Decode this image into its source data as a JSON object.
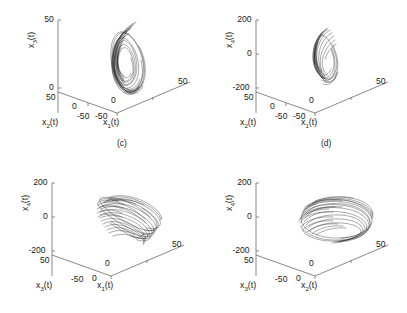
{
  "figure": {
    "type": "multi-panel-3d-phase-portrait",
    "panel_count": 4,
    "background_color": "#ffffff",
    "line_color": "#232323",
    "axis_color": "#6a6a6a",
    "captions": [
      {
        "id": "caption-c",
        "text": "(c)"
      },
      {
        "id": "caption-d",
        "text": "(d)"
      }
    ]
  },
  "chart_data": [
    {
      "id": "panel-c",
      "type": "line",
      "projection": "3d",
      "title": "(c)",
      "xlabel": "x_1(t)",
      "ylabel": "x_2(t)",
      "zlabel": "x_3(t)",
      "x_axis_label_base": "x",
      "x_axis_label_sub": "1",
      "x_axis_label_suffix": "(t)",
      "y_axis_label_base": "x",
      "y_axis_label_sub": "2",
      "y_axis_label_suffix": "(t)",
      "z_axis_label_base": "x",
      "z_axis_label_sub": "3",
      "z_axis_label_suffix": "(t)",
      "xticks": [
        "-50",
        "0",
        "50"
      ],
      "yticks": [
        "50",
        "0",
        "-50"
      ],
      "zticks": [
        "50",
        "0"
      ],
      "xlim": [
        -50,
        50
      ],
      "ylim": [
        -50,
        50
      ],
      "zlim": [
        0,
        50
      ],
      "grid": false,
      "legend": "none",
      "description": "Narrow vertically elongated chaotic attractor, dense nested loops"
    },
    {
      "id": "panel-d",
      "type": "line",
      "projection": "3d",
      "title": "(d)",
      "xlabel": "x_1(t)",
      "ylabel": "x_2(t)",
      "zlabel": "x_4(t)",
      "x_axis_label_base": "x",
      "x_axis_label_sub": "1",
      "x_axis_label_suffix": "(t)",
      "y_axis_label_base": "x",
      "y_axis_label_sub": "2",
      "y_axis_label_suffix": "(t)",
      "z_axis_label_base": "x",
      "z_axis_label_sub": "4",
      "z_axis_label_suffix": "(t)",
      "xticks": [
        "-50",
        "0",
        "50"
      ],
      "yticks": [
        "50",
        "0",
        "-50"
      ],
      "zticks": [
        "200",
        "0",
        "-200"
      ],
      "xlim": [
        -50,
        50
      ],
      "ylim": [
        -50,
        50
      ],
      "zlim": [
        -200,
        200
      ],
      "grid": false,
      "legend": "none",
      "description": "Compact spiky vertical attractor cluster near origin"
    },
    {
      "id": "panel-bottom-left",
      "type": "line",
      "projection": "3d",
      "title": "",
      "xlabel": "x_1(t)",
      "ylabel": "x_3(t)",
      "zlabel": "x_4(t)",
      "x_axis_label_base": "x",
      "x_axis_label_sub": "1",
      "x_axis_label_suffix": "(t)",
      "y_axis_label_base": "x",
      "y_axis_label_sub": "3",
      "y_axis_label_suffix": "(t)",
      "z_axis_label_base": "x",
      "z_axis_label_sub": "4",
      "z_axis_label_suffix": "(t)",
      "xticks": [
        "-50",
        "0",
        "50"
      ],
      "yticks": [
        "50",
        "0"
      ],
      "zticks": [
        "200",
        "0",
        "-200"
      ],
      "xlim": [
        -50,
        50
      ],
      "ylim": [
        0,
        50
      ],
      "zlim": [
        -200,
        200
      ],
      "grid": false,
      "legend": "none",
      "description": "Fan / feather shaped bundle of nested elongated loops opening to the right"
    },
    {
      "id": "panel-bottom-right",
      "type": "line",
      "projection": "3d",
      "title": "",
      "xlabel": "x_2(t)",
      "ylabel": "x_3(t)",
      "zlabel": "x_4(t)",
      "x_axis_label_base": "x",
      "x_axis_label_sub": "2",
      "x_axis_label_suffix": "(t)",
      "y_axis_label_base": "x",
      "y_axis_label_sub": "3",
      "y_axis_label_suffix": "(t)",
      "z_axis_label_base": "x",
      "z_axis_label_sub": "4",
      "z_axis_label_suffix": "(t)",
      "xticks": [
        "-50",
        "0",
        "50"
      ],
      "yticks": [
        "50",
        "0"
      ],
      "zticks": [
        "200",
        "0",
        "-200"
      ],
      "xlim": [
        -50,
        50
      ],
      "ylim": [
        0,
        50
      ],
      "zlim": [
        -200,
        200
      ],
      "grid": false,
      "legend": "none",
      "description": "Dense flattened torus of overlapping horizontal loops"
    }
  ]
}
